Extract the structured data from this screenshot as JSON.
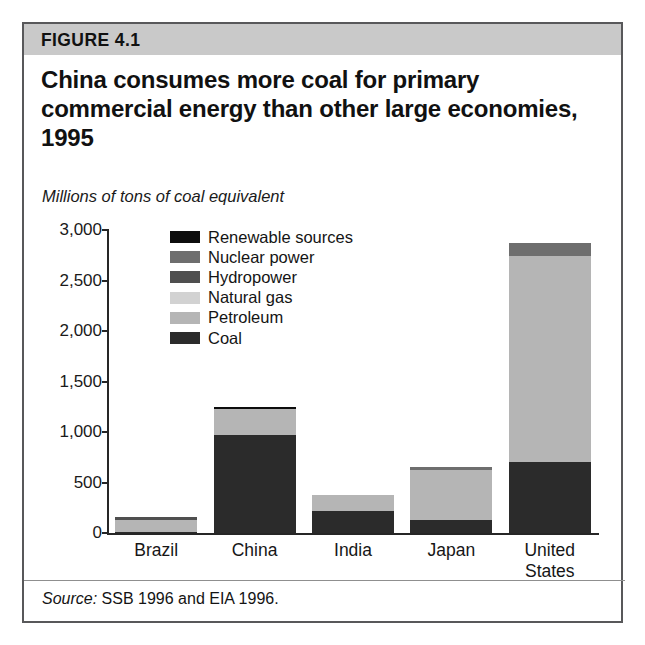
{
  "figure": {
    "label": "FIGURE 4.1",
    "title": "China consumes more coal for primary commercial energy than other large economies, 1995",
    "subtitle": "Millions of tons of coal equivalent",
    "source_word": "Source:",
    "source_text": " SSB 1996 and EIA 1996."
  },
  "chart_data": {
    "type": "bar",
    "stacked": true,
    "title": "China consumes more coal for primary commercial energy than other large economies, 1995",
    "subtitle": "Millions of tons of coal equivalent",
    "xlabel": "",
    "ylabel": "Millions of tons of coal equivalent",
    "ylim": [
      0,
      3000
    ],
    "ytick_labels": [
      "3,000",
      "2,500",
      "2,000",
      "1,500",
      "1,000",
      "500",
      "0"
    ],
    "ytick_values": [
      3000,
      2500,
      2000,
      1500,
      1000,
      500,
      0
    ],
    "grid": false,
    "legend_position": "inside-upper-left",
    "categories": [
      "Brazil",
      "China",
      "India",
      "Japan",
      "United States"
    ],
    "series": [
      {
        "name": "Coal",
        "color": "#2b2b2b",
        "values": [
          12,
          970,
          220,
          130,
          700
        ]
      },
      {
        "name": "Petroleum",
        "color": "#b5b5b5",
        "values": [
          118,
          260,
          155,
          490,
          2045
        ]
      },
      {
        "name": "Natural gas",
        "color": "#d2d2d2",
        "values": [
          4,
          0,
          0,
          0,
          0
        ]
      },
      {
        "name": "Hydropower",
        "color": "#4f4f4f",
        "values": [
          20,
          0,
          5,
          0,
          0
        ]
      },
      {
        "name": "Nuclear power",
        "color": "#6e6e6e",
        "values": [
          0,
          0,
          0,
          30,
          130
        ]
      },
      {
        "name": "Renewable sources",
        "color": "#0d0d0d",
        "values": [
          0,
          20,
          0,
          0,
          0
        ]
      }
    ],
    "totals": [
      154,
      1250,
      380,
      650,
      2875
    ]
  },
  "legend": {
    "items": [
      {
        "label": "Renewable sources",
        "color": "#0d0d0d"
      },
      {
        "label": "Nuclear power",
        "color": "#6e6e6e"
      },
      {
        "label": "Hydropower",
        "color": "#4f4f4f"
      },
      {
        "label": "Natural gas",
        "color": "#d2d2d2"
      },
      {
        "label": "Petroleum",
        "color": "#b5b5b5"
      },
      {
        "label": "Coal",
        "color": "#2b2b2b"
      }
    ]
  }
}
